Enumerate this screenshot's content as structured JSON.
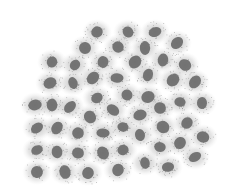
{
  "chart_data": {
    "type": "scatter",
    "title": "",
    "xlabel": "",
    "ylabel": "",
    "axes_visible": false,
    "grid": false,
    "legend": null,
    "point_color": "#6b6b6b",
    "halo_color": "#b8b8b8",
    "xlim": [
      0,
      233
    ],
    "ylim": [
      0,
      196
    ],
    "clusters": [
      {
        "x": 97,
        "y": 32
      },
      {
        "x": 128,
        "y": 32
      },
      {
        "x": 155,
        "y": 32
      },
      {
        "x": 85,
        "y": 48
      },
      {
        "x": 118,
        "y": 47
      },
      {
        "x": 145,
        "y": 48
      },
      {
        "x": 177,
        "y": 43
      },
      {
        "x": 52,
        "y": 62
      },
      {
        "x": 75,
        "y": 65
      },
      {
        "x": 103,
        "y": 62
      },
      {
        "x": 135,
        "y": 62
      },
      {
        "x": 163,
        "y": 60
      },
      {
        "x": 185,
        "y": 65
      },
      {
        "x": 50,
        "y": 83
      },
      {
        "x": 73,
        "y": 83
      },
      {
        "x": 93,
        "y": 78
      },
      {
        "x": 117,
        "y": 78
      },
      {
        "x": 148,
        "y": 75
      },
      {
        "x": 173,
        "y": 80
      },
      {
        "x": 195,
        "y": 82
      },
      {
        "x": 35,
        "y": 105
      },
      {
        "x": 52,
        "y": 105
      },
      {
        "x": 70,
        "y": 107
      },
      {
        "x": 97,
        "y": 98
      },
      {
        "x": 127,
        "y": 95
      },
      {
        "x": 148,
        "y": 97
      },
      {
        "x": 180,
        "y": 102
      },
      {
        "x": 202,
        "y": 103
      },
      {
        "x": 90,
        "y": 117
      },
      {
        "x": 113,
        "y": 110
      },
      {
        "x": 140,
        "y": 115
      },
      {
        "x": 160,
        "y": 108
      },
      {
        "x": 187,
        "y": 123
      },
      {
        "x": 37,
        "y": 128
      },
      {
        "x": 57,
        "y": 128
      },
      {
        "x": 78,
        "y": 133
      },
      {
        "x": 103,
        "y": 133
      },
      {
        "x": 123,
        "y": 127
      },
      {
        "x": 140,
        "y": 135
      },
      {
        "x": 163,
        "y": 127
      },
      {
        "x": 203,
        "y": 137
      },
      {
        "x": 37,
        "y": 150
      },
      {
        "x": 57,
        "y": 152
      },
      {
        "x": 78,
        "y": 153
      },
      {
        "x": 103,
        "y": 153
      },
      {
        "x": 123,
        "y": 150
      },
      {
        "x": 160,
        "y": 147
      },
      {
        "x": 180,
        "y": 143
      },
      {
        "x": 195,
        "y": 157
      },
      {
        "x": 37,
        "y": 172
      },
      {
        "x": 65,
        "y": 172
      },
      {
        "x": 88,
        "y": 173
      },
      {
        "x": 118,
        "y": 170
      },
      {
        "x": 145,
        "y": 163
      },
      {
        "x": 168,
        "y": 167
      }
    ]
  }
}
